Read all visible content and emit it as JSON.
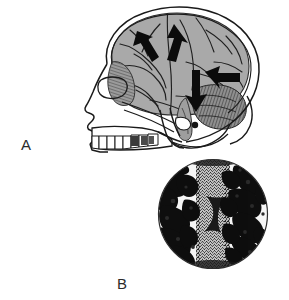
{
  "figure": {
    "type": "anatomical-illustration",
    "background_color": "#ffffff",
    "width": 289,
    "height": 300,
    "panels": [
      {
        "id": "A",
        "label": "A",
        "label_position": {
          "x": 21,
          "y": 137
        },
        "subject": "lateral view of human skull with brain in situ",
        "description": "Line drawing of a human skull in left lateral profile with the cerebrum, cerebellum and brainstem shaded in gray, overlaid with four solid black arrows indicating directions of force or spread",
        "elements": [
          {
            "name": "skull-outline",
            "style": "black contour line"
          },
          {
            "name": "cranial-vault",
            "style": "double outline"
          },
          {
            "name": "cerebrum",
            "fill": "#a9a9a9",
            "style": "gray shaded with dark sulci"
          },
          {
            "name": "cerebellum",
            "fill": "#8c8c8c",
            "style": "hatched striations"
          },
          {
            "name": "brainstem",
            "fill": "#9a9a9a"
          },
          {
            "name": "facial-skeleton",
            "style": "outline"
          },
          {
            "name": "maxillary-teeth",
            "count": 8,
            "style": "outline"
          },
          {
            "name": "mandible",
            "style": "outline"
          },
          {
            "name": "orbit",
            "style": "outline"
          },
          {
            "name": "nasal-aperture",
            "style": "outline"
          }
        ],
        "arrows": [
          {
            "id": "arrow-1",
            "direction": "up-left",
            "region": "frontal lobe"
          },
          {
            "id": "arrow-2",
            "direction": "up-right",
            "region": "superior frontal / precentral"
          },
          {
            "id": "arrow-3",
            "direction": "right",
            "region": "occipital lobe"
          },
          {
            "id": "arrow-4",
            "direction": "down",
            "region": "cerebellum / tentorium"
          }
        ]
      },
      {
        "id": "B",
        "label": "B",
        "label_position": {
          "x": 117,
          "y": 276
        },
        "subject": "circular photomicrograph inset",
        "description": "Round field-of-view micrograph showing dense dark irregular trabecular tissue flanking a lighter vertically striated central band",
        "circle": {
          "cx": 213,
          "cy": 214,
          "r": 55
        },
        "border_color": "#3a3a3a",
        "elements": [
          {
            "name": "field-border-circle",
            "style": "thin black ring"
          },
          {
            "name": "central-striated-band",
            "fill": "#6e6e6e",
            "style": "fine vertical stippling"
          },
          {
            "name": "left-trabecular-mass",
            "fill": "#101010"
          },
          {
            "name": "right-trabecular-mass",
            "fill": "#101010"
          },
          {
            "name": "background-matrix",
            "fill": "#f2f2f2"
          }
        ]
      }
    ],
    "colors": {
      "ink": "#1a1a1a",
      "brain_gray": "#a9a9a9",
      "cerebellum_gray": "#8c8c8c",
      "label_color": "#2b2b2b",
      "background": "#ffffff"
    }
  }
}
